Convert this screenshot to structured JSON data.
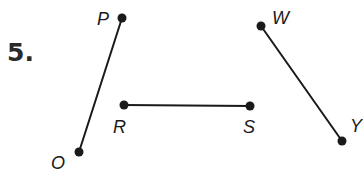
{
  "problem": {
    "number": "5."
  },
  "colors": {
    "ink": "#1a1a1a",
    "background": "#ffffff"
  },
  "points": {
    "P": {
      "label": "P",
      "x": 122,
      "y": 18
    },
    "O": {
      "label": "O",
      "x": 79,
      "y": 152
    },
    "R": {
      "label": "R",
      "x": 124,
      "y": 105
    },
    "S": {
      "label": "S",
      "x": 250,
      "y": 106
    },
    "W": {
      "label": "W",
      "x": 261,
      "y": 26
    },
    "Y": {
      "label": "Y",
      "x": 342,
      "y": 141
    }
  },
  "segments": [
    {
      "name": "segment-PO",
      "from": "P",
      "to": "O"
    },
    {
      "name": "segment-RS",
      "from": "R",
      "to": "S"
    },
    {
      "name": "segment-WY",
      "from": "W",
      "to": "Y"
    }
  ]
}
